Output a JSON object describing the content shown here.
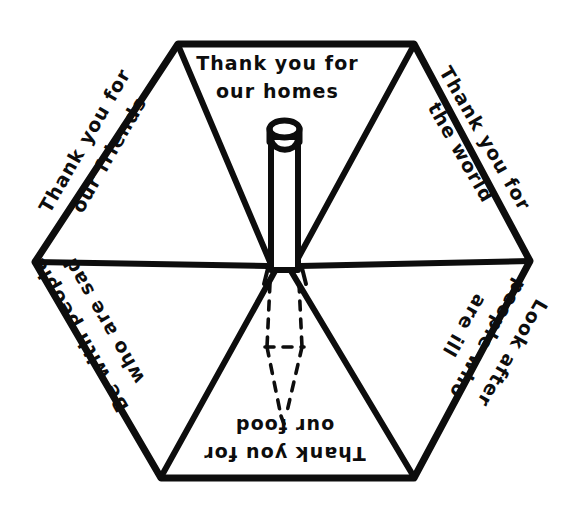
{
  "image": {
    "title": "Umbrella prayer hexagon",
    "background_color": "#ffffff",
    "ink_color": "#0d0d0d"
  },
  "umbrella": {
    "panels": [
      {
        "id": "top",
        "position": "top",
        "rotation_deg": 0,
        "text": "Thank you for our homes"
      },
      {
        "id": "upper-right",
        "position": "upper-right",
        "rotation_deg": 60,
        "text": "Thank you for the world"
      },
      {
        "id": "lower-right",
        "position": "lower-right",
        "rotation_deg": 120,
        "text": "Look after people who are ill"
      },
      {
        "id": "bottom",
        "position": "bottom",
        "rotation_deg": 180,
        "text": "Thank you for our food"
      },
      {
        "id": "lower-left",
        "position": "lower-left",
        "rotation_deg": 240,
        "text": "Be with people who are sad"
      },
      {
        "id": "upper-left",
        "position": "upper-left",
        "rotation_deg": 300,
        "text": "Thank you for our friends"
      }
    ],
    "parts": {
      "canopy_shape": "hexagon",
      "ferrule_label": "pole-top",
      "hidden_handle_label": "dashed-handle"
    }
  }
}
